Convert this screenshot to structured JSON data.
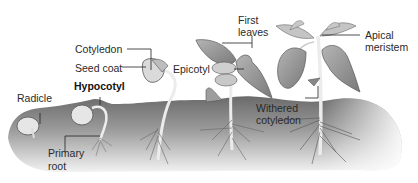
{
  "diagram": {
    "type": "bean seed germination stages",
    "stages": 5,
    "colors": {
      "soil_dark": "#6e6e6e",
      "soil_light": "#d8d8d8",
      "leaf": "#9a9a9a",
      "leaf_dark": "#7c7c7c",
      "seed": "#e4e4e4",
      "stem": "#e9e9e9",
      "label_text": "#2a2a2a",
      "leader_line": "#222222"
    }
  },
  "labels": {
    "cotyledon": "Cotyledon",
    "seed_coat": "Seed coat",
    "hypocotyl": "Hypocotyl",
    "radicle": "Radicle",
    "primary_root_line1": "Primary",
    "primary_root_line2": "root",
    "epicotyl": "Epicotyl",
    "first_leaves_line1": "First",
    "first_leaves_line2": "leaves",
    "apical_meristem_line1": "Apical",
    "apical_meristem_line2": "meristem",
    "withered_cotyledon_line1": "Withered",
    "withered_cotyledon_line2": "cotyledon"
  }
}
